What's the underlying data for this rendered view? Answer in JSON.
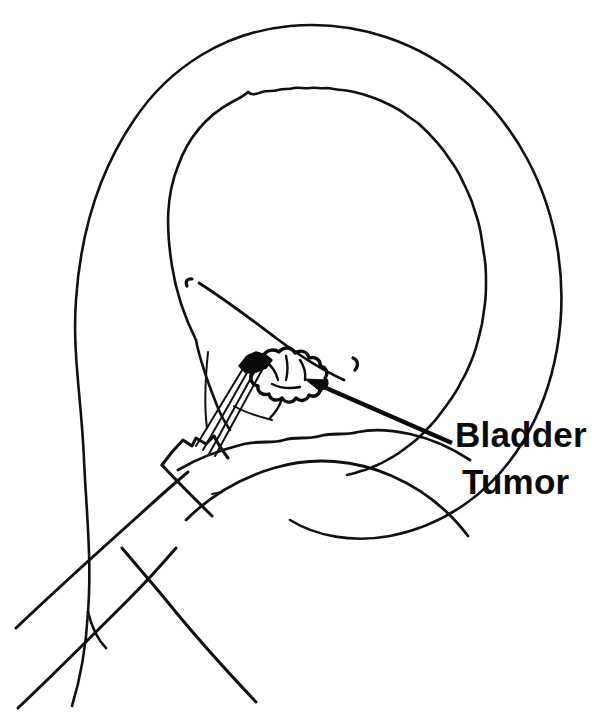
{
  "figure": {
    "kind": "medical-line-drawing",
    "background_color": "#ffffff",
    "line_color": "#0b0b0b",
    "width": 603,
    "height": 715
  },
  "labels": {
    "callout": {
      "line1": "Bladder",
      "line2": "Tumor",
      "x": 455,
      "y": 447,
      "font_size": 35,
      "font_weight": "bold",
      "color": "#0b0b0b"
    }
  },
  "annotations": {
    "arrow": {
      "name": "tumor-pointer-arrow",
      "from_x": 452,
      "from_y": 443,
      "to_x": 305,
      "to_y": 380,
      "style": "solid-line-with-filled-head"
    }
  },
  "structures": [
    {
      "name": "bladder-outer-wall",
      "description": "smooth outer serosal contour of the distended bladder"
    },
    {
      "name": "bladder-inner-mucosa",
      "description": "wavy scalloped mucosal lining inside the outer wall"
    },
    {
      "name": "bladder-tumor",
      "description": "lobulated papillary cauliflower-like mass on the posterior wall"
    },
    {
      "name": "resectoscope-sheath",
      "description": "instrument shaft entering through the urethra"
    },
    {
      "name": "resection-loop-wire",
      "description": "thin wire loop electrode extended toward the tumor"
    },
    {
      "name": "bladder-neck",
      "description": "notched beak of the scope at the bladder neck"
    },
    {
      "name": "trigone-ridge",
      "description": "interureteric ridge curving across the bladder base"
    },
    {
      "name": "ureteral-orifice-left",
      "description": "small comma-shaped opening, left"
    },
    {
      "name": "ureteral-orifice-right",
      "description": "small comma-shaped opening, right"
    },
    {
      "name": "urethra-wall",
      "description": "paired lines forming the urethral channel"
    }
  ]
}
